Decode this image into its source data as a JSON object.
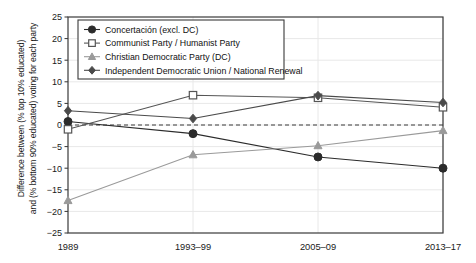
{
  "chart_data": {
    "type": "line",
    "title": "",
    "xlabel": "",
    "ylabel_line1": "Difference between (% top 10% educated)",
    "ylabel_line2": "and (% bottom 90% educated) voting for each party",
    "categories": [
      "1989",
      "1993–99",
      "2005–09",
      "2013–17"
    ],
    "ylim": [
      -25,
      25
    ],
    "yticks": [
      25,
      20,
      15,
      10,
      5,
      0,
      -5,
      -10,
      -15,
      -20,
      -25
    ],
    "ytick_labels": [
      "25",
      "20",
      "15",
      "10",
      "5",
      "0",
      "−5",
      "−10",
      "−15",
      "−20",
      "−25"
    ],
    "grid": "horizontal-light",
    "zero_reference_line": true,
    "legend_position": "top-left-inside",
    "series": [
      {
        "name": "Concertación (excl. DC)",
        "marker": "filled-circle",
        "color": "#2b2b2b",
        "values": [
          0.8,
          -2.0,
          -7.4,
          -10.0
        ]
      },
      {
        "name": "Communist Party / Humanist Party",
        "marker": "open-square",
        "color": "#555555",
        "values": [
          -1.0,
          6.9,
          6.3,
          4.1
        ]
      },
      {
        "name": "Christian Democratic Party (DC)",
        "marker": "filled-triangle",
        "color": "#9a9a9a",
        "values": [
          -17.5,
          -6.9,
          -4.8,
          -1.3
        ]
      },
      {
        "name": "Independent Democratic Union / National Renewal",
        "marker": "filled-diamond",
        "color": "#4a4a4a",
        "values": [
          3.3,
          1.5,
          6.8,
          5.2
        ]
      }
    ]
  }
}
